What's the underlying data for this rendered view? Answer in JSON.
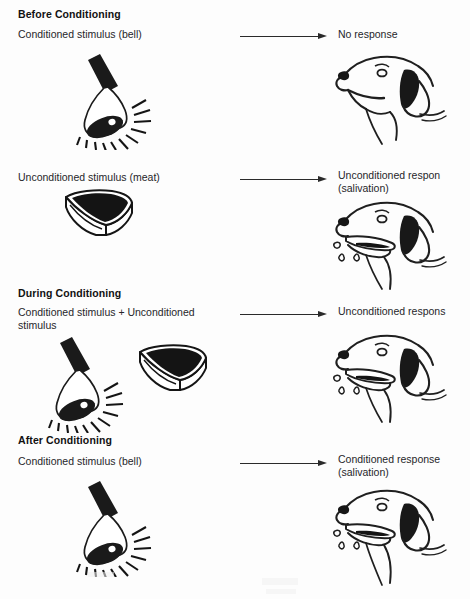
{
  "diagram": {
    "background_color": "#fdfdfd",
    "ink_color": "#1c1c1c",
    "arrow_color": "#2a2a2a"
  },
  "sections": [
    {
      "heading": "Before Conditioning",
      "stimulus_label": "Conditioned stimulus (bell)",
      "response_label": "No response",
      "stimulus_icons": [
        "bell-icon"
      ],
      "response_icon": "dog-head-neutral-icon",
      "arrow": "right-arrow-icon"
    },
    {
      "heading": "",
      "stimulus_label": "Unconditioned stimulus (meat)",
      "response_label": "Unconditioned respon\n(salivation)",
      "response_label_line1": "Unconditioned respon",
      "response_label_line2": "(salivation)",
      "stimulus_icons": [
        "meat-icon"
      ],
      "response_icon": "dog-head-salivating-icon",
      "arrow": "right-arrow-icon"
    },
    {
      "heading": "During Conditioning",
      "stimulus_label": "Conditioned stimulus + Unconditioned stimulus",
      "stimulus_label_line1": "Conditioned stimulus + Unconditioned",
      "stimulus_label_line2": "stimulus",
      "response_label": "Unconditioned respons",
      "stimulus_icons": [
        "bell-icon",
        "meat-icon"
      ],
      "response_icon": "dog-head-salivating-icon",
      "arrow": "right-arrow-icon"
    },
    {
      "heading": "After Conditioning",
      "stimulus_label": "Conditioned stimulus (bell)",
      "response_label": "Conditioned response\n(salivation)",
      "response_label_line1": "Conditioned response",
      "response_label_line2": "(salivation)",
      "stimulus_icons": [
        "bell-icon"
      ],
      "response_icon": "dog-head-salivating-icon",
      "arrow": "right-arrow-icon"
    }
  ]
}
